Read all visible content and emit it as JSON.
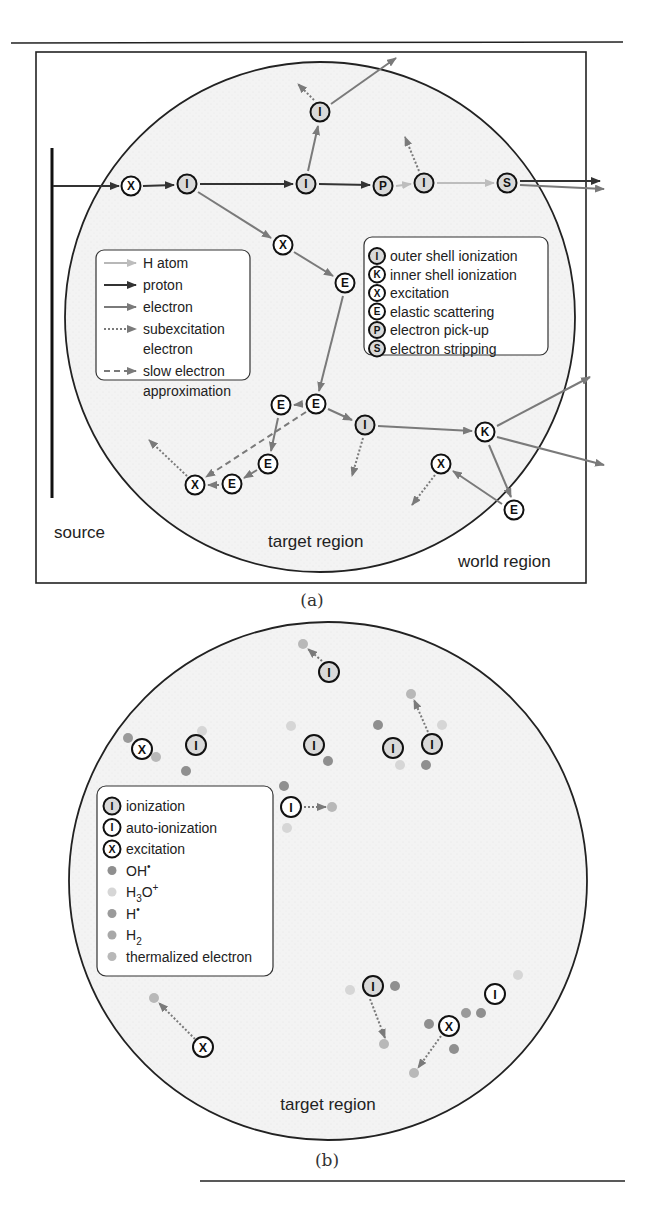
{
  "figure": {
    "panel_a": {
      "caption": "(a)",
      "region_labels": {
        "source": "source",
        "target": "target region",
        "world": "world region"
      },
      "legend_particles": [
        {
          "label": "H atom",
          "style": "solid",
          "color": "#b8b8b8"
        },
        {
          "label": "proton",
          "style": "solid",
          "color": "#333333"
        },
        {
          "label": "electron",
          "style": "solid",
          "color": "#7a7a7a"
        },
        {
          "label": "subexcitation",
          "label2": "electron",
          "style": "dotted",
          "color": "#7a7a7a"
        },
        {
          "label": "slow electron",
          "label2": "approximation",
          "style": "dashed",
          "color": "#7a7a7a"
        }
      ],
      "legend_processes": [
        {
          "symbol": "I",
          "label": "outer shell ionization",
          "fill": "#d9d9d9"
        },
        {
          "symbol": "K",
          "label": "inner shell ionization",
          "fill": "#ffffff"
        },
        {
          "symbol": "X",
          "label": "excitation",
          "fill": "#ffffff"
        },
        {
          "symbol": "E",
          "label": "elastic scattering",
          "fill": "#ffffff"
        },
        {
          "symbol": "P",
          "label": "electron pick-up",
          "fill": "#d9d9d9"
        },
        {
          "symbol": "S",
          "label": "electron stripping",
          "fill": "#d9d9d9"
        }
      ],
      "nodes": [
        {
          "id": "x1",
          "symbol": "X",
          "x": 131,
          "y": 186,
          "fill": "#ffffff"
        },
        {
          "id": "i1",
          "symbol": "I",
          "x": 187,
          "y": 184,
          "fill": "#d9d9d9"
        },
        {
          "id": "i2",
          "symbol": "I",
          "x": 306,
          "y": 184,
          "fill": "#d9d9d9"
        },
        {
          "id": "i3",
          "symbol": "I",
          "x": 320,
          "y": 112,
          "fill": "#d9d9d9"
        },
        {
          "id": "p1",
          "symbol": "P",
          "x": 383,
          "y": 186,
          "fill": "#d9d9d9"
        },
        {
          "id": "i4",
          "symbol": "I",
          "x": 424,
          "y": 183,
          "fill": "#d9d9d9"
        },
        {
          "id": "s1",
          "symbol": "S",
          "x": 507,
          "y": 183,
          "fill": "#d9d9d9"
        },
        {
          "id": "x2",
          "symbol": "X",
          "x": 283,
          "y": 245,
          "fill": "#ffffff"
        },
        {
          "id": "e1",
          "symbol": "E",
          "x": 345,
          "y": 283,
          "fill": "#ffffff"
        },
        {
          "id": "e2",
          "symbol": "E",
          "x": 316,
          "y": 404,
          "fill": "#ffffff"
        },
        {
          "id": "e3",
          "symbol": "E",
          "x": 281,
          "y": 405,
          "fill": "#ffffff"
        },
        {
          "id": "i5",
          "symbol": "I",
          "x": 365,
          "y": 425,
          "fill": "#d9d9d9"
        },
        {
          "id": "k1",
          "symbol": "K",
          "x": 485,
          "y": 432,
          "fill": "#ffffff"
        },
        {
          "id": "e4",
          "symbol": "E",
          "x": 268,
          "y": 464,
          "fill": "#ffffff"
        },
        {
          "id": "e5",
          "symbol": "E",
          "x": 232,
          "y": 484,
          "fill": "#ffffff"
        },
        {
          "id": "x3",
          "symbol": "X",
          "x": 195,
          "y": 485,
          "fill": "#ffffff"
        },
        {
          "id": "x4",
          "symbol": "X",
          "x": 441,
          "y": 464,
          "fill": "#ffffff"
        },
        {
          "id": "e6",
          "symbol": "E",
          "x": 514,
          "y": 510,
          "fill": "#ffffff"
        }
      ]
    },
    "panel_b": {
      "caption": "(b)",
      "region_label": "target region",
      "legend": [
        {
          "kind": "node",
          "symbol": "I",
          "label": "ionization",
          "fill": "#d9d9d9"
        },
        {
          "kind": "node",
          "symbol": "I",
          "label": "auto-ionization",
          "fill": "#ffffff"
        },
        {
          "kind": "node",
          "symbol": "X",
          "label": "excitation",
          "fill": "#ffffff"
        },
        {
          "kind": "dot",
          "label": "OH",
          "sup": "•",
          "sub": "",
          "color": "#8f8f8f"
        },
        {
          "kind": "dot",
          "label": "H",
          "sub": "3",
          "label_tail": "O",
          "sup": "+",
          "color": "#d6d6d6"
        },
        {
          "kind": "dot",
          "label": "H",
          "sup": "•",
          "sub": "",
          "color": "#9a9a9a"
        },
        {
          "kind": "dot",
          "label": "H",
          "sub": "2",
          "sup": "",
          "color": "#a8a8a8"
        },
        {
          "kind": "dot",
          "label": "thermalized electron",
          "sup": "",
          "sub": "",
          "color": "#b8b8b8"
        }
      ],
      "nodes": [
        {
          "symbol": "I",
          "x": 329,
          "y": 672,
          "fill": "#d9d9d9"
        },
        {
          "symbol": "X",
          "x": 142,
          "y": 749,
          "fill": "#ffffff"
        },
        {
          "symbol": "I",
          "x": 196,
          "y": 745,
          "fill": "#d9d9d9"
        },
        {
          "symbol": "I",
          "x": 314,
          "y": 745,
          "fill": "#d9d9d9"
        },
        {
          "symbol": "I",
          "x": 393,
          "y": 748,
          "fill": "#d9d9d9"
        },
        {
          "symbol": "I",
          "x": 432,
          "y": 744,
          "fill": "#d9d9d9"
        },
        {
          "symbol": "I",
          "x": 291,
          "y": 807,
          "fill": "#ffffff"
        },
        {
          "symbol": "I",
          "x": 373,
          "y": 986,
          "fill": "#d9d9d9"
        },
        {
          "symbol": "I",
          "x": 495,
          "y": 994,
          "fill": "#ffffff"
        },
        {
          "symbol": "X",
          "x": 449,
          "y": 1026,
          "fill": "#ffffff"
        },
        {
          "symbol": "X",
          "x": 203,
          "y": 1047,
          "fill": "#ffffff"
        }
      ]
    }
  }
}
